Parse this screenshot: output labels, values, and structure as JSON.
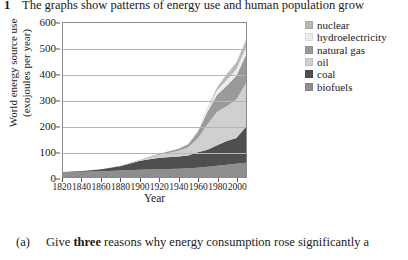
{
  "question": {
    "number": "1",
    "stem": "The graphs show patterns of energy use and human population grow"
  },
  "part_a": {
    "label": "(a)",
    "text_before": "Give ",
    "emphasis": "three",
    "text_after": " reasons why energy consumption rose significantly a"
  },
  "chart_data": {
    "type": "area",
    "title": "",
    "xlabel": "Year",
    "ylabel_line1": "World energy source use",
    "ylabel_line2": "(exojoules per year)",
    "xlim": [
      1820,
      2010
    ],
    "ylim": [
      0,
      600
    ],
    "yticks": [
      600,
      500,
      400,
      300,
      200,
      100,
      0
    ],
    "ytick_labels": [
      "600",
      "500",
      "400",
      "300",
      "200",
      "100",
      "0"
    ],
    "xticks": [
      1820,
      1840,
      1860,
      1880,
      1900,
      1920,
      1940,
      1960,
      1980,
      2000
    ],
    "xtick_labels": [
      "1820",
      "1840",
      "1860",
      "1880",
      "1900",
      "1920",
      "1940",
      "1960",
      "1980",
      "2000"
    ],
    "grid": true,
    "stacked": true,
    "legend_position": "right",
    "x": [
      1820,
      1840,
      1860,
      1880,
      1900,
      1920,
      1940,
      1950,
      1960,
      1970,
      1980,
      1990,
      2000,
      2010
    ],
    "series": [
      {
        "name": "biofuels",
        "color": "#8e8e8e",
        "values": [
          18,
          20,
          22,
          25,
          28,
          30,
          32,
          34,
          36,
          40,
          44,
          48,
          52,
          56
        ]
      },
      {
        "name": "coal",
        "color": "#4f4f4f",
        "values": [
          1,
          3,
          8,
          18,
          35,
          45,
          48,
          50,
          60,
          66,
          80,
          92,
          100,
          140
        ]
      },
      {
        "name": "oil",
        "color": "#d0d0d0",
        "values": [
          0,
          0,
          0,
          1,
          3,
          12,
          22,
          32,
          55,
          100,
          130,
          136,
          150,
          170
        ]
      },
      {
        "name": "natural gas",
        "color": "#9a9a9a",
        "values": [
          0,
          0,
          0,
          0,
          1,
          4,
          8,
          12,
          25,
          48,
          66,
          80,
          92,
          110
        ]
      },
      {
        "name": "hydroelectricity",
        "color": "#ededed",
        "values": [
          0,
          0,
          0,
          0,
          0,
          1,
          2,
          4,
          7,
          12,
          18,
          22,
          26,
          30
        ]
      },
      {
        "name": "nuclear",
        "color": "#b8b8b8",
        "values": [
          0,
          0,
          0,
          0,
          0,
          0,
          0,
          0,
          1,
          3,
          12,
          22,
          26,
          28
        ]
      }
    ],
    "legend_entries": [
      {
        "label": "nuclear",
        "color": "#b8b8b8"
      },
      {
        "label": "hydroelectricity",
        "color": "#ededed"
      },
      {
        "label": "natural gas",
        "color": "#9a9a9a"
      },
      {
        "label": "oil",
        "color": "#d0d0d0"
      },
      {
        "label": "coal",
        "color": "#4f4f4f"
      },
      {
        "label": "biofuels",
        "color": "#8e8e8e"
      }
    ]
  }
}
